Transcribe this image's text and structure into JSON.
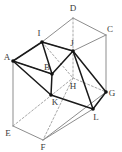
{
  "figure": {
    "type": "3d-polyhedron-line-drawing",
    "width": 122,
    "height": 151,
    "colors": {
      "box_edge": "#8d8d8d",
      "hidden_edge": "#a8a8a8",
      "solid_edge": "#1a1a1a",
      "vertex_dot": "#111111",
      "label_text": "#3a3a3a",
      "background": "#ffffff"
    },
    "vertices": [
      {
        "name": "A",
        "x": 13,
        "y": 61,
        "label_x": 7,
        "label_y": 57,
        "dot": true
      },
      {
        "name": "B",
        "x": 52,
        "y": 74,
        "label_x": 47,
        "label_y": 67,
        "dot": true
      },
      {
        "name": "C",
        "x": 106,
        "y": 35,
        "label_x": 110,
        "label_y": 29,
        "dot": false
      },
      {
        "name": "D",
        "x": 73,
        "y": 18,
        "label_x": 73,
        "label_y": 8,
        "dot": false
      },
      {
        "name": "E",
        "x": 13,
        "y": 126,
        "label_x": 8,
        "label_y": 133,
        "dot": false
      },
      {
        "name": "F",
        "x": 43,
        "y": 140,
        "label_x": 43,
        "label_y": 147,
        "dot": false
      },
      {
        "name": "G",
        "x": 106,
        "y": 92,
        "label_x": 112,
        "label_y": 93,
        "dot": true
      },
      {
        "name": "H",
        "x": 73,
        "y": 78,
        "label_x": 73,
        "label_y": 86,
        "dot": false
      },
      {
        "name": "I",
        "x": 42,
        "y": 42,
        "label_x": 39,
        "label_y": 33,
        "dot": true
      },
      {
        "name": "J",
        "x": 73,
        "y": 51,
        "label_x": 72,
        "label_y": 43,
        "dot": true
      },
      {
        "name": "K",
        "x": 51,
        "y": 95,
        "label_x": 55,
        "label_y": 102,
        "dot": true
      },
      {
        "name": "L",
        "x": 93,
        "y": 109,
        "label_x": 96,
        "label_y": 117,
        "dot": true
      }
    ],
    "edges_box_visible": [
      [
        "A",
        "I"
      ],
      [
        "I",
        "D"
      ],
      [
        "D",
        "C"
      ],
      [
        "C",
        "G"
      ],
      [
        "A",
        "E"
      ],
      [
        "E",
        "F"
      ],
      [
        "F",
        "G"
      ],
      [
        "C",
        "J"
      ],
      [
        "I",
        "J"
      ],
      [
        "F",
        "L"
      ],
      [
        "A",
        "B"
      ]
    ],
    "edges_box_hidden": [
      [
        "D",
        "H"
      ],
      [
        "H",
        "G"
      ],
      [
        "E",
        "H"
      ],
      [
        "H",
        "F"
      ],
      [
        "I",
        "H"
      ]
    ],
    "edges_solid": [
      [
        "A",
        "I"
      ],
      [
        "I",
        "J"
      ],
      [
        "A",
        "B"
      ],
      [
        "B",
        "J"
      ],
      [
        "B",
        "K"
      ],
      [
        "K",
        "L"
      ],
      [
        "J",
        "L"
      ],
      [
        "J",
        "G"
      ],
      [
        "L",
        "G"
      ],
      [
        "A",
        "K"
      ],
      [
        "I",
        "B"
      ]
    ],
    "labels": [
      "A",
      "B",
      "C",
      "D",
      "E",
      "F",
      "G",
      "H",
      "I",
      "J",
      "K",
      "L"
    ]
  }
}
